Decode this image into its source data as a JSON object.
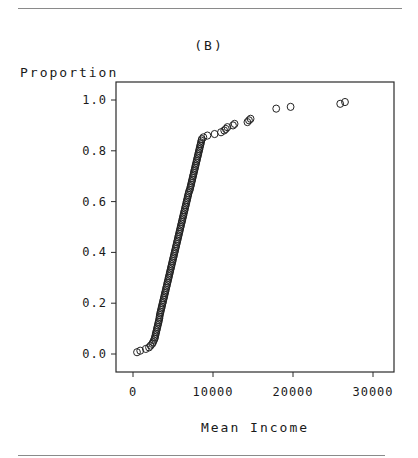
{
  "figure": {
    "panel_label": "(B)",
    "ylabel": "Proportion",
    "xlabel": "Mean Income"
  },
  "chart_data": {
    "type": "scatter",
    "title": "(B)",
    "xlabel": "Mean Income",
    "ylabel": "Proportion",
    "xlim": [
      -1500,
      32500
    ],
    "ylim": [
      -0.07,
      1.07
    ],
    "xticks": [
      0,
      10000,
      20000,
      30000
    ],
    "xtick_labels": [
      "0",
      "10000",
      "20000",
      "30000"
    ],
    "yticks": [
      0.0,
      0.2,
      0.4,
      0.6,
      0.8,
      1.0
    ],
    "ytick_labels": [
      "0.0",
      "0.2",
      "0.4",
      "0.6",
      "0.8",
      "1.0"
    ],
    "grid": false,
    "legend": null,
    "marker": "open-circle",
    "series": [
      {
        "name": "Mean Income ECDF",
        "points": [
          [
            500,
            0.007
          ],
          [
            900,
            0.013
          ],
          [
            1600,
            0.02
          ],
          [
            2000,
            0.026
          ],
          [
            2200,
            0.033
          ],
          [
            2400,
            0.04
          ],
          [
            2500,
            0.046
          ],
          [
            2600,
            0.053
          ],
          [
            2700,
            0.06
          ],
          [
            2750,
            0.066
          ],
          [
            2800,
            0.073
          ],
          [
            2850,
            0.08
          ],
          [
            2900,
            0.086
          ],
          [
            2950,
            0.093
          ],
          [
            3000,
            0.1
          ],
          [
            3050,
            0.106
          ],
          [
            3100,
            0.113
          ],
          [
            3150,
            0.12
          ],
          [
            3200,
            0.126
          ],
          [
            3250,
            0.133
          ],
          [
            3300,
            0.14
          ],
          [
            3320,
            0.146
          ],
          [
            3350,
            0.153
          ],
          [
            3400,
            0.16
          ],
          [
            3450,
            0.166
          ],
          [
            3500,
            0.173
          ],
          [
            3550,
            0.18
          ],
          [
            3600,
            0.186
          ],
          [
            3650,
            0.193
          ],
          [
            3700,
            0.2
          ],
          [
            3750,
            0.206
          ],
          [
            3800,
            0.213
          ],
          [
            3850,
            0.22
          ],
          [
            3900,
            0.226
          ],
          [
            3950,
            0.233
          ],
          [
            4000,
            0.24
          ],
          [
            4050,
            0.246
          ],
          [
            4100,
            0.253
          ],
          [
            4150,
            0.26
          ],
          [
            4200,
            0.266
          ],
          [
            4250,
            0.273
          ],
          [
            4300,
            0.28
          ],
          [
            4350,
            0.286
          ],
          [
            4400,
            0.293
          ],
          [
            4450,
            0.3
          ],
          [
            4500,
            0.306
          ],
          [
            4550,
            0.313
          ],
          [
            4600,
            0.32
          ],
          [
            4650,
            0.326
          ],
          [
            4700,
            0.333
          ],
          [
            4750,
            0.34
          ],
          [
            4800,
            0.346
          ],
          [
            4850,
            0.353
          ],
          [
            4900,
            0.36
          ],
          [
            4950,
            0.366
          ],
          [
            5000,
            0.373
          ],
          [
            5050,
            0.38
          ],
          [
            5100,
            0.386
          ],
          [
            5150,
            0.393
          ],
          [
            5200,
            0.4
          ],
          [
            5250,
            0.406
          ],
          [
            5300,
            0.413
          ],
          [
            5350,
            0.42
          ],
          [
            5400,
            0.426
          ],
          [
            5450,
            0.433
          ],
          [
            5500,
            0.44
          ],
          [
            5550,
            0.446
          ],
          [
            5600,
            0.453
          ],
          [
            5650,
            0.46
          ],
          [
            5700,
            0.466
          ],
          [
            5750,
            0.473
          ],
          [
            5800,
            0.48
          ],
          [
            5850,
            0.486
          ],
          [
            5900,
            0.493
          ],
          [
            5950,
            0.5
          ],
          [
            6000,
            0.506
          ],
          [
            6050,
            0.513
          ],
          [
            6100,
            0.52
          ],
          [
            6150,
            0.526
          ],
          [
            6200,
            0.533
          ],
          [
            6250,
            0.54
          ],
          [
            6300,
            0.546
          ],
          [
            6350,
            0.553
          ],
          [
            6400,
            0.56
          ],
          [
            6450,
            0.566
          ],
          [
            6500,
            0.573
          ],
          [
            6550,
            0.58
          ],
          [
            6600,
            0.586
          ],
          [
            6650,
            0.593
          ],
          [
            6700,
            0.6
          ],
          [
            6750,
            0.606
          ],
          [
            6800,
            0.613
          ],
          [
            6850,
            0.62
          ],
          [
            6900,
            0.626
          ],
          [
            6950,
            0.633
          ],
          [
            7000,
            0.64
          ],
          [
            7100,
            0.646
          ],
          [
            7150,
            0.653
          ],
          [
            7200,
            0.66
          ],
          [
            7250,
            0.666
          ],
          [
            7300,
            0.673
          ],
          [
            7350,
            0.68
          ],
          [
            7400,
            0.686
          ],
          [
            7450,
            0.693
          ],
          [
            7500,
            0.7
          ],
          [
            7550,
            0.706
          ],
          [
            7600,
            0.713
          ],
          [
            7650,
            0.72
          ],
          [
            7700,
            0.726
          ],
          [
            7750,
            0.733
          ],
          [
            7800,
            0.74
          ],
          [
            7850,
            0.746
          ],
          [
            7900,
            0.753
          ],
          [
            7950,
            0.76
          ],
          [
            8000,
            0.766
          ],
          [
            8050,
            0.773
          ],
          [
            8100,
            0.78
          ],
          [
            8150,
            0.786
          ],
          [
            8200,
            0.793
          ],
          [
            8250,
            0.8
          ],
          [
            8300,
            0.806
          ],
          [
            8350,
            0.813
          ],
          [
            8400,
            0.82
          ],
          [
            8450,
            0.826
          ],
          [
            8500,
            0.833
          ],
          [
            8550,
            0.84
          ],
          [
            8600,
            0.846
          ],
          [
            8800,
            0.853
          ],
          [
            9300,
            0.86
          ],
          [
            10200,
            0.866
          ],
          [
            11000,
            0.873
          ],
          [
            11400,
            0.88
          ],
          [
            11600,
            0.886
          ],
          [
            11800,
            0.893
          ],
          [
            12500,
            0.9
          ],
          [
            12700,
            0.906
          ],
          [
            14300,
            0.913
          ],
          [
            14500,
            0.92
          ],
          [
            14700,
            0.926
          ],
          [
            17900,
            0.966
          ],
          [
            19700,
            0.973
          ],
          [
            25900,
            0.985
          ],
          [
            26500,
            0.992
          ]
        ]
      }
    ]
  }
}
